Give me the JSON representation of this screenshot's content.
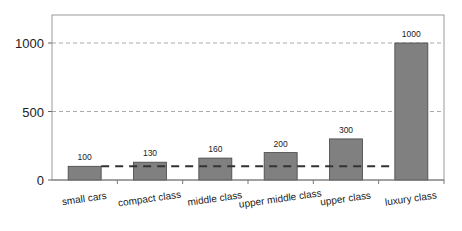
{
  "chart_data": {
    "type": "bar",
    "title": "",
    "xlabel": "",
    "ylabel": "",
    "categories": [
      "small cars",
      "compact class",
      "middle class",
      "upper middle class",
      "upper class",
      "luxury class"
    ],
    "values": [
      100,
      130,
      160,
      200,
      300,
      1000
    ],
    "data_labels": [
      "100",
      "130",
      "160",
      "200",
      "300",
      "1000"
    ],
    "ylim": [
      0,
      1200
    ],
    "yticks": [
      0,
      500,
      1000
    ],
    "ytick_labels": [
      "0",
      "500",
      "1000"
    ],
    "grid": "horizontal dashed at 500 and 1000",
    "reference_line": {
      "value": 100,
      "style": "dashed",
      "color": "#333333"
    },
    "bar_color": "#808080",
    "legend": null
  }
}
